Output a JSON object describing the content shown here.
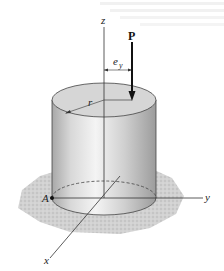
{
  "diagram": {
    "labels": {
      "z_axis": "z",
      "y_axis": "y",
      "x_axis": "x",
      "load": "P",
      "eccentricity": "e",
      "eccentricity_sub": "y",
      "radius": "r",
      "point": "A"
    },
    "colors": {
      "cylinder_light": "#f2f2f2",
      "cylinder_dark": "#9a9a9a",
      "top_face": "#d4d4d4",
      "ground": "#c8c8c8",
      "line": "#333333"
    }
  }
}
